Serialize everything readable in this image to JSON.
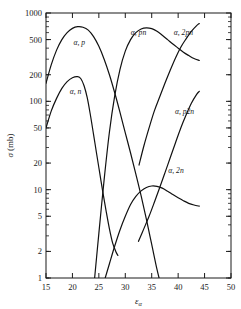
{
  "chart_data": {
    "type": "line",
    "title": "",
    "xlabel": "εα",
    "ylabel": "σ (mb)",
    "xscale": "linear",
    "yscale": "log",
    "xlim": [
      15,
      50
    ],
    "ylim": [
      1,
      1000
    ],
    "grid": false,
    "legend_position": "inline-curve-labels",
    "x_ticks": [
      15,
      20,
      25,
      30,
      35,
      40,
      45,
      50
    ],
    "x_tick_labels": [
      "15",
      "20",
      "25",
      "30",
      "35",
      "40",
      "45",
      "50"
    ],
    "y_ticks": [
      1,
      2,
      5,
      10,
      20,
      50,
      100,
      200,
      500,
      1000
    ],
    "y_tick_labels": [
      "1",
      "2",
      "5",
      "10",
      "20",
      "50",
      "100",
      "200",
      "500",
      "1000"
    ],
    "series": [
      {
        "name": "α, p",
        "label": "α, p",
        "label_x": 21.3,
        "label_y": 430,
        "points": [
          [
            15.0,
            160
          ],
          [
            16.0,
            260
          ],
          [
            17.0,
            380
          ],
          [
            18.0,
            500
          ],
          [
            19.0,
            600
          ],
          [
            20.0,
            670
          ],
          [
            21.0,
            700
          ],
          [
            22.0,
            690
          ],
          [
            23.0,
            640
          ],
          [
            24.0,
            540
          ],
          [
            25.0,
            420
          ],
          [
            26.0,
            300
          ],
          [
            27.0,
            200
          ],
          [
            28.0,
            125
          ],
          [
            29.0,
            75
          ],
          [
            30.0,
            44
          ],
          [
            31.0,
            26
          ],
          [
            32.0,
            15
          ],
          [
            33.0,
            8.5
          ],
          [
            34.0,
            4.6
          ],
          [
            35.0,
            2.4
          ],
          [
            36.0,
            1.25
          ],
          [
            36.7,
            0.85
          ]
        ]
      },
      {
        "name": "α, n",
        "label": "α, n",
        "label_x": 20.6,
        "label_y": 120,
        "points": [
          [
            15.0,
            50
          ],
          [
            16.0,
            78
          ],
          [
            17.0,
            108
          ],
          [
            18.0,
            140
          ],
          [
            19.0,
            167
          ],
          [
            20.0,
            185
          ],
          [
            21.0,
            190
          ],
          [
            21.6,
            180
          ],
          [
            22.2,
            150
          ],
          [
            22.8,
            110
          ],
          [
            23.4,
            70
          ],
          [
            24.0,
            42
          ],
          [
            24.6,
            25
          ],
          [
            25.2,
            15
          ],
          [
            25.8,
            9
          ],
          [
            26.4,
            5.6
          ],
          [
            27.0,
            3.6
          ],
          [
            27.6,
            2.5
          ],
          [
            28.2,
            2.0
          ],
          [
            28.6,
            1.8
          ]
        ]
      },
      {
        "name": "α, pn",
        "label": "α, pn",
        "label_x": 32.5,
        "label_y": 560,
        "points": [
          [
            24.2,
            1.0
          ],
          [
            25.0,
            3.2
          ],
          [
            26.0,
            13
          ],
          [
            27.0,
            45
          ],
          [
            28.0,
            115
          ],
          [
            29.0,
            230
          ],
          [
            30.0,
            370
          ],
          [
            31.0,
            500
          ],
          [
            32.0,
            600
          ],
          [
            33.0,
            660
          ],
          [
            34.0,
            680
          ],
          [
            35.0,
            665
          ],
          [
            36.0,
            620
          ],
          [
            37.0,
            560
          ],
          [
            38.0,
            500
          ],
          [
            39.0,
            445
          ],
          [
            40.0,
            400
          ],
          [
            41.0,
            360
          ],
          [
            42.0,
            330
          ],
          [
            43.0,
            305
          ],
          [
            44.0,
            290
          ]
        ]
      },
      {
        "name": "α, 2pn",
        "label": "α, 2pn",
        "label_x": 41.0,
        "label_y": 560,
        "points": [
          [
            32.6,
            19
          ],
          [
            33.5,
            31
          ],
          [
            34.5,
            50
          ],
          [
            35.5,
            78
          ],
          [
            36.5,
            112
          ],
          [
            37.5,
            160
          ],
          [
            38.5,
            225
          ],
          [
            39.5,
            310
          ],
          [
            40.5,
            410
          ],
          [
            41.5,
            510
          ],
          [
            42.5,
            620
          ],
          [
            43.5,
            720
          ],
          [
            44.0,
            760
          ]
        ]
      },
      {
        "name": "α, p2n",
        "label": "α, p2n",
        "label_x": 41.2,
        "label_y": 72,
        "points": [
          [
            32.5,
            2.6
          ],
          [
            33.5,
            3.6
          ],
          [
            34.5,
            5.0
          ],
          [
            35.5,
            7.2
          ],
          [
            36.5,
            10.5
          ],
          [
            37.5,
            15.5
          ],
          [
            38.5,
            23
          ],
          [
            39.5,
            34
          ],
          [
            40.5,
            50
          ],
          [
            41.5,
            70
          ],
          [
            42.5,
            95
          ],
          [
            43.5,
            120
          ],
          [
            44.0,
            130
          ]
        ]
      },
      {
        "name": "α, 2n",
        "label": "α, 2n",
        "label_x": 39.6,
        "label_y": 15.5,
        "points": [
          [
            26.2,
            1.0
          ],
          [
            27.0,
            1.45
          ],
          [
            28.0,
            2.3
          ],
          [
            29.0,
            3.5
          ],
          [
            30.0,
            5.0
          ],
          [
            31.0,
            6.8
          ],
          [
            32.0,
            8.4
          ],
          [
            33.0,
            9.7
          ],
          [
            34.0,
            10.6
          ],
          [
            35.0,
            11.0
          ],
          [
            36.0,
            10.9
          ],
          [
            37.0,
            10.4
          ],
          [
            38.0,
            9.6
          ],
          [
            39.0,
            8.8
          ],
          [
            40.0,
            8.1
          ],
          [
            41.0,
            7.5
          ],
          [
            42.0,
            7.0
          ],
          [
            43.0,
            6.7
          ],
          [
            44.0,
            6.5
          ]
        ]
      }
    ]
  }
}
